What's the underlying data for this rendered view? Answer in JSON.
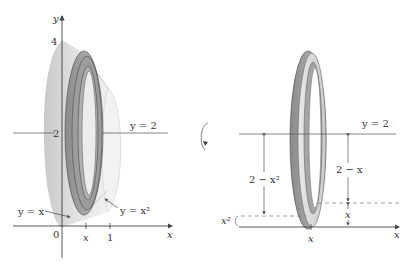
{
  "figure": {
    "left_panel": {
      "axis_labels": {
        "x": "x",
        "y": "y"
      },
      "tick_labels": {
        "origin": "0",
        "x_mark": "x",
        "x_one": "1",
        "y_two": "2",
        "y_four": "4"
      },
      "line_label": "y = 2",
      "curve_labels": {
        "line": "y = x",
        "parabola": "y = x²"
      }
    },
    "rotation_icon": "rotate-arrow-icon",
    "right_panel": {
      "axis_labels": {
        "x": "x"
      },
      "tick_labels": {
        "x_mark": "x"
      },
      "line_label": "y = 2",
      "dimension_labels": {
        "outer_radius": "2 − x²",
        "inner_radius": "2 − x",
        "lower_offset": "x²",
        "inner_offset": "x"
      }
    },
    "colors": {
      "solid_fill": "#d9d9d9",
      "washer_dark": "#8f8f8f",
      "washer_mid": "#b5b5b5",
      "washer_light": "#d7d7d7",
      "line": "#555555"
    }
  }
}
